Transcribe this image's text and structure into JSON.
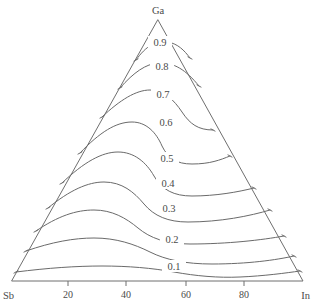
{
  "figure": {
    "type": "ternary-contour-diagram",
    "background_color": "#ffffff",
    "line_color": "#6a6a6a",
    "text_color": "#4a4a4a"
  },
  "chart_data": {
    "type": "line",
    "title": "",
    "subtitle": "",
    "xlabel": "",
    "ylabel": "",
    "grid": false,
    "legend": null,
    "plot_kind": "ternary contour plot",
    "vertices": [
      {
        "id": "top",
        "label": "Ga",
        "px": [
          158,
          20
        ]
      },
      {
        "id": "bottom-left",
        "label": "Sb",
        "px": [
          12,
          281
        ]
      },
      {
        "id": "bottom-right",
        "label": "In",
        "px": [
          303,
          281
        ]
      }
    ],
    "bottom_axis": {
      "label_left": "Sb",
      "label_right": "In",
      "tick_labels": [
        "20",
        "40",
        "60",
        "80"
      ],
      "tick_values": [
        20,
        40,
        60,
        80
      ],
      "tick_px_x": [
        68,
        126,
        186,
        244
      ],
      "range": [
        0,
        100
      ]
    },
    "contours": {
      "levels": [
        0.9,
        0.8,
        0.7,
        0.6,
        0.5,
        0.4,
        0.3,
        0.2,
        0.1
      ],
      "level_labels": [
        "0.9",
        "0.8",
        "0.7",
        "0.6",
        "0.5",
        "0.4",
        "0.3",
        "0.2",
        "0.1"
      ],
      "label_px": [
        [
          160,
          44
        ],
        [
          162,
          68
        ],
        [
          163,
          96
        ],
        [
          166,
          124
        ],
        [
          167,
          160
        ],
        [
          168,
          185
        ],
        [
          169,
          210
        ],
        [
          172,
          241
        ],
        [
          174,
          268
        ]
      ],
      "paths": [
        {
          "level": 0.9,
          "d": "M 136,60 C 146,46 156,40 168,42 C 178,44 184,50 190,58"
        },
        {
          "level": 0.8,
          "d": "M 120,88 C 134,72 146,64 158,63 C 174,62 186,70 199,86"
        },
        {
          "level": 0.7,
          "d": "M 102,117 C 120,100 136,90 150,90 C 164,90 174,100 182,112 C 190,124 198,130 213,130"
        },
        {
          "level": 0.6,
          "d": "M 80,153 C 100,132 116,122 132,122 C 146,122 156,132 162,146 C 168,158 176,164 192,164 C 210,164 220,160 230,156"
        },
        {
          "level": 0.5,
          "d": "M 62,183 C 84,162 102,152 118,152 C 134,152 146,162 154,176 C 162,190 174,196 192,196 C 216,196 238,192 254,188"
        },
        {
          "level": 0.4,
          "d": "M 48,208 C 70,190 88,182 104,182 C 122,182 134,192 144,204 C 154,216 168,222 188,222 C 220,222 250,216 270,210"
        },
        {
          "level": 0.3,
          "d": "M 36,231 C 58,216 76,210 94,210 C 112,210 126,218 138,228 C 150,238 166,244 190,244 C 228,244 262,240 284,236"
        },
        {
          "level": 0.2,
          "d": "M 26,251 C 52,242 74,238 94,238 C 116,238 134,244 150,252 C 166,260 186,264 212,264 C 248,264 276,260 294,256"
        },
        {
          "level": 0.1,
          "d": "M 16,272 C 48,268 76,266 102,266 C 128,266 152,268 174,272 C 196,276 218,278 240,277 C 264,276 286,273 300,271"
        }
      ],
      "edge_ticks_left": [
        [
          136,
          60
        ],
        [
          120,
          88
        ],
        [
          102,
          117
        ],
        [
          80,
          153
        ],
        [
          62,
          183
        ],
        [
          48,
          208
        ],
        [
          36,
          231
        ],
        [
          26,
          251
        ],
        [
          16,
          272
        ]
      ],
      "edge_ticks_right": [
        [
          190,
          58
        ],
        [
          199,
          86
        ],
        [
          213,
          130
        ],
        [
          230,
          156
        ],
        [
          254,
          188
        ],
        [
          270,
          210
        ],
        [
          284,
          236
        ],
        [
          294,
          256
        ],
        [
          300,
          271
        ]
      ]
    }
  }
}
